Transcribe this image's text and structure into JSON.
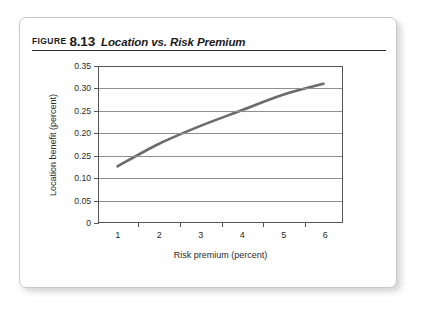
{
  "caption": {
    "figure_word": "FIGURE",
    "figure_number": "8.13",
    "title": "Location vs. Risk Premium"
  },
  "chart_data": {
    "type": "line",
    "title": "Location vs. Risk Premium",
    "xlabel": "Risk premium (percent)",
    "ylabel": "Location benefit (percent)",
    "x": [
      1,
      2,
      3,
      4,
      5,
      6
    ],
    "values": [
      0.125,
      0.175,
      0.215,
      0.25,
      0.285,
      0.31
    ],
    "series": [
      {
        "name": "Location benefit",
        "values": [
          0.125,
          0.175,
          0.215,
          0.25,
          0.285,
          0.31
        ]
      }
    ],
    "xlim": [
      0.55,
      6.45
    ],
    "ylim": [
      0,
      0.35
    ],
    "x_tick_labels": [
      "1",
      "2",
      "3",
      "4",
      "5",
      "6"
    ],
    "y_tick_labels": [
      "0.35",
      "0.30",
      "0.25",
      "0.20",
      "0.25",
      "0.10",
      "0.05",
      "0"
    ],
    "y_tick_values": [
      0.35,
      0.3,
      0.25,
      0.2,
      0.15,
      0.1,
      0.05,
      0
    ],
    "grid": "horizontal",
    "legend": "none",
    "line_color": "#6b6b6b",
    "grid_color": "#8f8f8f",
    "axis_color": "#555555"
  }
}
